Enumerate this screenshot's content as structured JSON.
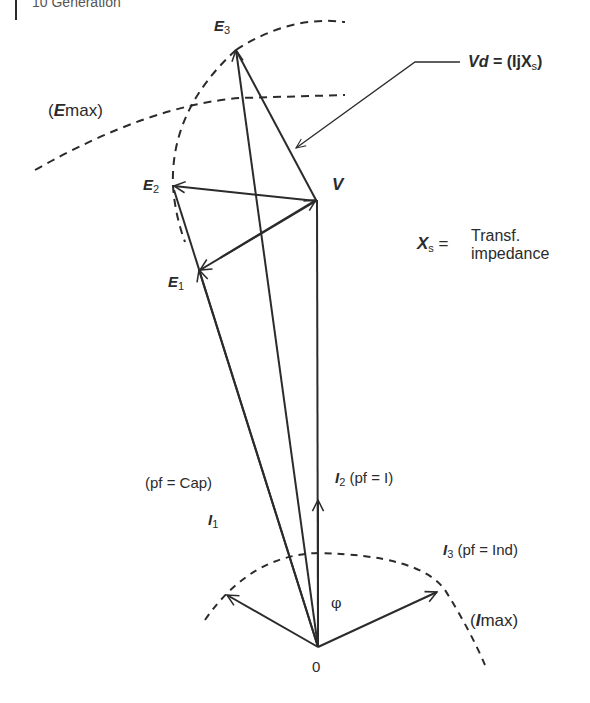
{
  "header": {
    "text": "10  Generation"
  },
  "labels": {
    "E3": {
      "main": "E",
      "sub": "3"
    },
    "E2": {
      "main": "E",
      "sub": "2"
    },
    "E1": {
      "main": "E",
      "sub": "1"
    },
    "V": "V",
    "Emax": {
      "open": "(",
      "main": "E",
      "sub": "max",
      "close": ")"
    },
    "Vd": {
      "main": "Vd",
      "eq": " = (IjX",
      "sub": "s",
      "close": ")"
    },
    "Xs": {
      "main": "X",
      "sub": "s",
      "eq": " ="
    },
    "Xs_desc_line1": "Transf.",
    "Xs_desc_line2": "impedance",
    "pf_cap": "(pf = Cap)",
    "I1": {
      "main": "I",
      "sub": "1"
    },
    "I2": {
      "main": "I",
      "sub": "2",
      "pf": " (pf = I)"
    },
    "I3": {
      "main": "I",
      "sub": "3",
      "pf": " (pf = Ind)"
    },
    "Imax": {
      "open": "(",
      "main": "I",
      "sub": "max",
      "close": ")"
    },
    "phi": "φ",
    "origin": "0"
  },
  "colors": {
    "stroke": "#2b2b2b",
    "background": "#ffffff"
  }
}
